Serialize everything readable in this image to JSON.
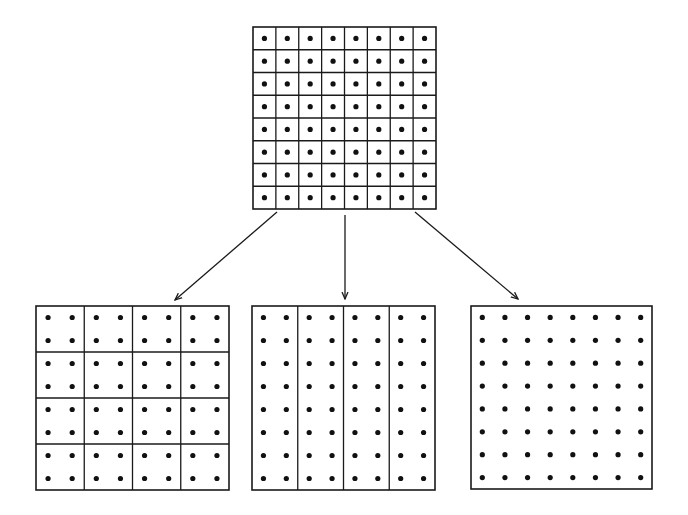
{
  "figure": {
    "colors": {
      "line": "#1a1a1a",
      "dot": "#111111",
      "background": "#ffffff"
    },
    "dots_per_side": 8,
    "source": {
      "label": "fine-grid",
      "x": 253,
      "y": 27,
      "w": 183,
      "h": 182,
      "partition": {
        "cols": 8,
        "rows": 8
      }
    },
    "targets": [
      {
        "label": "block-partition-4x4",
        "x": 36,
        "y": 306,
        "w": 193,
        "h": 184,
        "partition": {
          "cols": 4,
          "rows": 4
        }
      },
      {
        "label": "strip-partition-4x1",
        "x": 252,
        "y": 306,
        "w": 183,
        "h": 184,
        "partition": {
          "cols": 4,
          "rows": 1
        }
      },
      {
        "label": "no-partition",
        "x": 471,
        "y": 306,
        "w": 181,
        "h": 183,
        "partition": {
          "cols": 1,
          "rows": 1
        }
      }
    ],
    "arrows": [
      {
        "label": "arrow-to-blocks",
        "x1": 277,
        "y1": 212,
        "x2": 175,
        "y2": 300
      },
      {
        "label": "arrow-to-strips",
        "x1": 345,
        "y1": 215,
        "x2": 345,
        "y2": 299
      },
      {
        "label": "arrow-to-whole",
        "x1": 415,
        "y1": 212,
        "x2": 518,
        "y2": 299
      }
    ]
  }
}
